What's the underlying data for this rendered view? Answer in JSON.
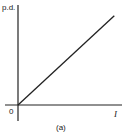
{
  "diagram": {
    "type": "linear-graph",
    "y_axis_label": "p.d.",
    "x_axis_label": "I",
    "origin_label": "0",
    "caption": "(a)",
    "relationship": "straight line through origin (p.d. proportional to I)",
    "line_color": "#222222",
    "axis_color": "#222222"
  },
  "chart_data": {
    "type": "line",
    "title": "",
    "xlabel": "I",
    "ylabel": "p.d.",
    "x": [
      0,
      1
    ],
    "series": [
      {
        "name": "p.d. vs I",
        "values": [
          0,
          1
        ]
      }
    ],
    "xlim": [
      0,
      1.08
    ],
    "ylim": [
      0,
      1.12
    ],
    "grid": false,
    "caption": "(a)"
  }
}
